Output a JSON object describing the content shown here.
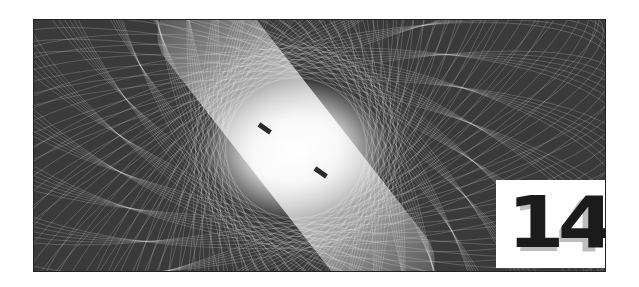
{
  "image": {
    "description": "Dark framed graphic with white spirograph moire line pattern and bright diagonal light band",
    "background_color": "#3a3a3a",
    "line_color": "#ffffff"
  },
  "badge": {
    "number": "14",
    "shadow_number": "14",
    "background": "#ffffff",
    "text_color": "#1b1b1b",
    "shadow_color": "#bdbdbd"
  }
}
